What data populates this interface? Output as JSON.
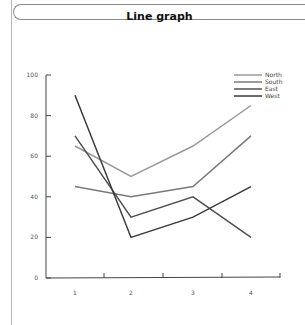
{
  "title": "Line graph",
  "chart_data": {
    "type": "line",
    "title": "Line graph",
    "xlabel": "",
    "ylabel": "",
    "x": [
      "1",
      "2",
      "3",
      "4"
    ],
    "y_ticks": [
      "0",
      "20",
      "40",
      "60",
      "80",
      "100"
    ],
    "ylim": [
      0,
      100
    ],
    "grid": false,
    "legend_position": "top-right",
    "series": [
      {
        "name": "North",
        "color": "#9a9a9a",
        "values": [
          65,
          50,
          65,
          85
        ]
      },
      {
        "name": "South",
        "color": "#7a7a7a",
        "values": [
          45,
          40,
          45,
          70
        ]
      },
      {
        "name": "East",
        "color": "#505050",
        "values": [
          70,
          30,
          40,
          20
        ]
      },
      {
        "name": "West",
        "color": "#3a3a3a",
        "values": [
          90,
          20,
          30,
          45
        ]
      }
    ]
  }
}
